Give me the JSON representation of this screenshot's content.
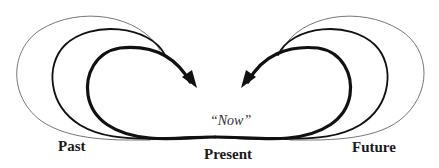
{
  "diagram": {
    "type": "temporal-loops",
    "labels": {
      "past": "Past",
      "present": "Present",
      "future": "Future",
      "now": "“Now”"
    },
    "colors": {
      "stroke": "#111111",
      "thin_stroke": "#555555",
      "background": "#ffffff"
    },
    "loops": {
      "left": [
        {
          "weight": "thin",
          "description": "outermost past loop"
        },
        {
          "weight": "medium",
          "description": "middle past loop"
        },
        {
          "weight": "thick",
          "description": "innermost past loop with arrowhead pointing toward now"
        }
      ],
      "right": [
        {
          "weight": "thin",
          "description": "outermost future loop"
        },
        {
          "weight": "medium",
          "description": "middle future loop"
        },
        {
          "weight": "thick",
          "description": "innermost future loop with arrowhead pointing toward now"
        }
      ]
    }
  }
}
